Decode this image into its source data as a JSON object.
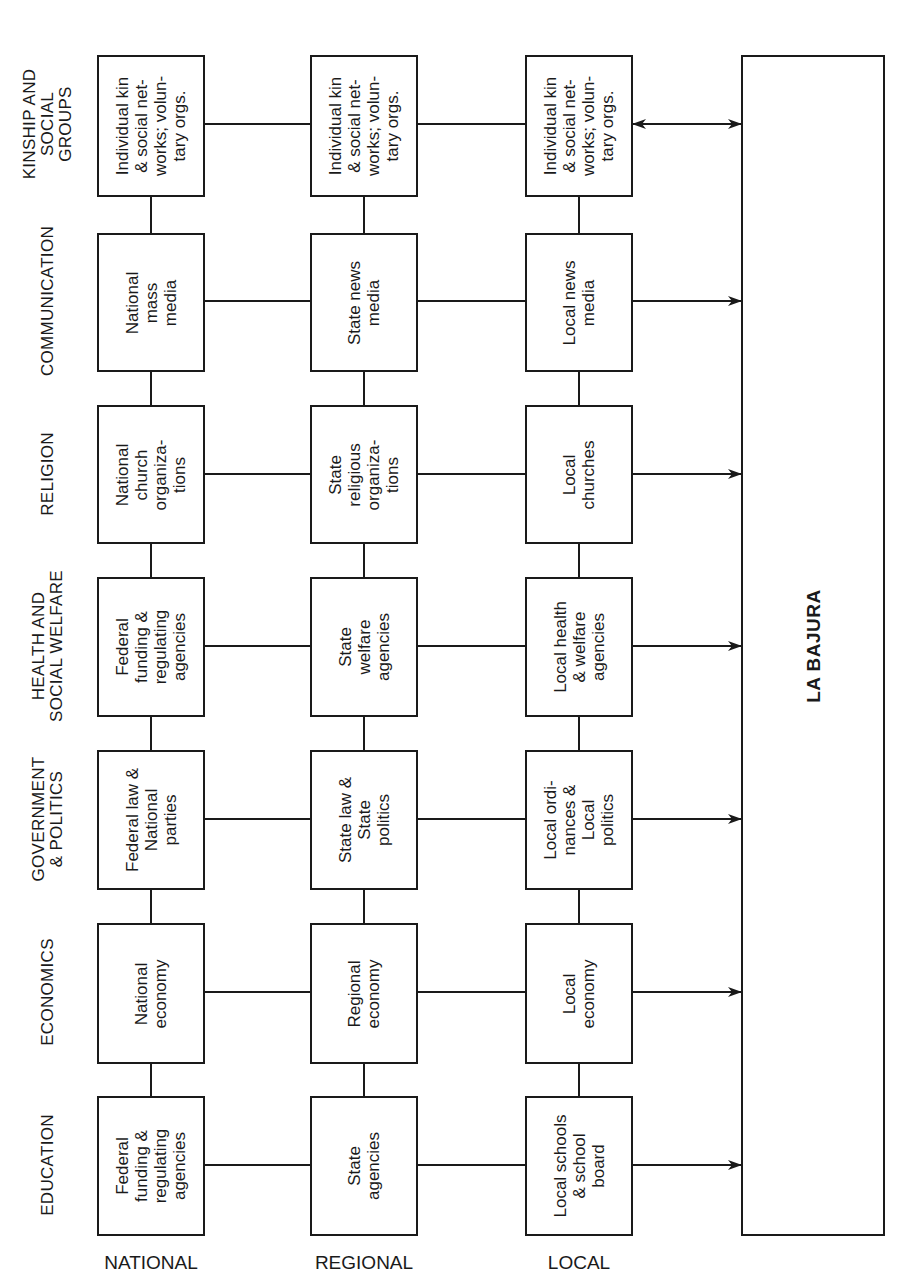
{
  "diagram": {
    "target": {
      "label": "LA BAJURA"
    },
    "columns": [
      {
        "id": "national",
        "label": "NATIONAL"
      },
      {
        "id": "regional",
        "label": "REGIONAL"
      },
      {
        "id": "local",
        "label": "LOCAL"
      }
    ],
    "rows": [
      {
        "id": "kinship",
        "label": "KINSHIP AND\nSOCIAL\nGROUPS",
        "national": "Individual kin\n& social net-\nworks; volun-\ntary orgs.",
        "regional": "Individual kin\n& social net-\nworks; volun-\ntary orgs.",
        "local": "Individual kin\n& social net-\nworks; volun-\ntary orgs.",
        "arrow": "bidirectional"
      },
      {
        "id": "communication",
        "label": "COMMUNICATION",
        "national": "National\nmass\nmedia",
        "regional": "State news\nmedia",
        "local": "Local news\nmedia",
        "arrow": "to-target"
      },
      {
        "id": "religion",
        "label": "RELIGION",
        "national": "National\nchurch\norganiza-\ntions",
        "regional": "State\nreligious\norganiza-\ntions",
        "local": "Local\nchurches",
        "arrow": "to-target"
      },
      {
        "id": "health",
        "label": "HEALTH AND\nSOCIAL WELFARE",
        "national": "Federal\nfunding &\nregulating\nagencies",
        "regional": "State\nwelfare\nagencies",
        "local": "Local health\n& welfare\nagencies",
        "arrow": "to-target"
      },
      {
        "id": "government",
        "label": "GOVERNMENT\n& POLITICS",
        "national": "Federal law &\nNational\nparties",
        "regional": "State law &\nState\npolitics",
        "local": "Local ordi-\nnances &\nLocal\npolitics",
        "arrow": "to-target"
      },
      {
        "id": "economics",
        "label": "ECONOMICS",
        "national": "National\neconomy",
        "regional": "Regional\neconomy",
        "local": "Local\neconomy",
        "arrow": "to-target"
      },
      {
        "id": "education",
        "label": "EDUCATION",
        "national": "Federal\nfunding &\nregulating\nagencies",
        "regional": "State\nagencies",
        "local": "Local schools\n& school\nboard",
        "arrow": "to-target"
      }
    ]
  }
}
